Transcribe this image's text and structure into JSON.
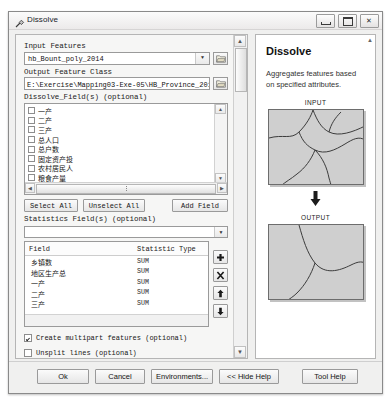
{
  "window": {
    "title": "Dissolve",
    "icon": "tool-hammer-icon",
    "controls": {
      "minimize": "–",
      "maximize": "□",
      "close": "✕"
    }
  },
  "form": {
    "input_features": {
      "label": "Input Features",
      "value": "hb_Bount_poly_2014",
      "browse_icon": "folder-browse-icon",
      "dropdown_icon": "chevron-down-icon"
    },
    "output_feature_class": {
      "label": "Output Feature Class",
      "value": "E:\\Exercise\\Mapping03-Exe-05\\HB_Province_2014.shp",
      "browse_icon": "folder-browse-icon"
    },
    "dissolve_fields": {
      "label": "Dissolve_Field(s) (optional)",
      "items": [
        {
          "name": "一产",
          "checked": false,
          "mono": false
        },
        {
          "name": "二产",
          "checked": false,
          "mono": false
        },
        {
          "name": "三产",
          "checked": false,
          "mono": false
        },
        {
          "name": "总人口",
          "checked": false,
          "mono": false
        },
        {
          "name": "总户数",
          "checked": false,
          "mono": false
        },
        {
          "name": "固定资产投",
          "checked": false,
          "mono": false
        },
        {
          "name": "农村居民人",
          "checked": false,
          "mono": false
        },
        {
          "name": "粮食产量",
          "checked": false,
          "mono": false
        },
        {
          "name": "CNTY_Code2",
          "checked": true,
          "mono": true
        }
      ]
    },
    "buttons": {
      "select_all": "Select All",
      "unselect_all": "Unselect All",
      "add_field": "Add Field"
    },
    "statistics_fields": {
      "label": "Statistics Field(s) (optional)",
      "headers": {
        "field": "Field",
        "stat": "Statistic Type"
      },
      "rows": [
        {
          "field": "乡镇数",
          "stat": "SUM"
        },
        {
          "field": "地区生产总",
          "stat": "SUM"
        },
        {
          "field": "一产",
          "stat": "SUM"
        },
        {
          "field": "二产",
          "stat": "SUM"
        },
        {
          "field": "三产",
          "stat": "SUM"
        }
      ],
      "side_buttons": [
        "add-row-icon",
        "delete-row-icon",
        "move-up-icon",
        "move-down-icon"
      ]
    },
    "create_multipart": {
      "label": "Create multipart features (optional)",
      "checked": true
    },
    "unsplit_lines": {
      "label": "Unsplit lines (optional)",
      "checked": false
    }
  },
  "help": {
    "title": "Dissolve",
    "description": "Aggregates features based on specified attributes.",
    "input_label": "INPUT",
    "output_label": "OUTPUT",
    "arrow_icon": "down-arrow-icon"
  },
  "footer": {
    "ok": "Ok",
    "cancel": "Cancel",
    "environments": "Environments...",
    "hide_help": "<< Hide Help",
    "tool_help": "Tool Help"
  }
}
